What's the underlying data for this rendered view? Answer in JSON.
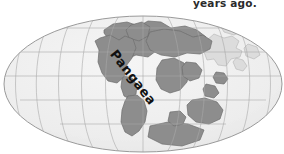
{
  "figure": {
    "name": "pangaea-world-map",
    "caption_fragment": "years ago.",
    "background_color": "#ffffff"
  },
  "map": {
    "projection": "mollweide-elliptical",
    "label": "Pangaea",
    "ocean_color": "#efefef",
    "ocean_edge_color": "#d8d8d8",
    "land_color": "#8e8e8e",
    "land_faint_color": "#d2d2d2",
    "land_outline_color": "#6f6f6f",
    "graticule_color": "#a9a9a9",
    "outline_color": "#9a9a9a",
    "graticule": {
      "meridian_count": 11,
      "parallel_count": 5,
      "parallels_y": [
        28,
        52,
        76,
        100,
        124
      ],
      "equator_y": 76,
      "center_x": 143,
      "center_y": 84,
      "radius_x": 139,
      "radius_y": 68
    }
  }
}
